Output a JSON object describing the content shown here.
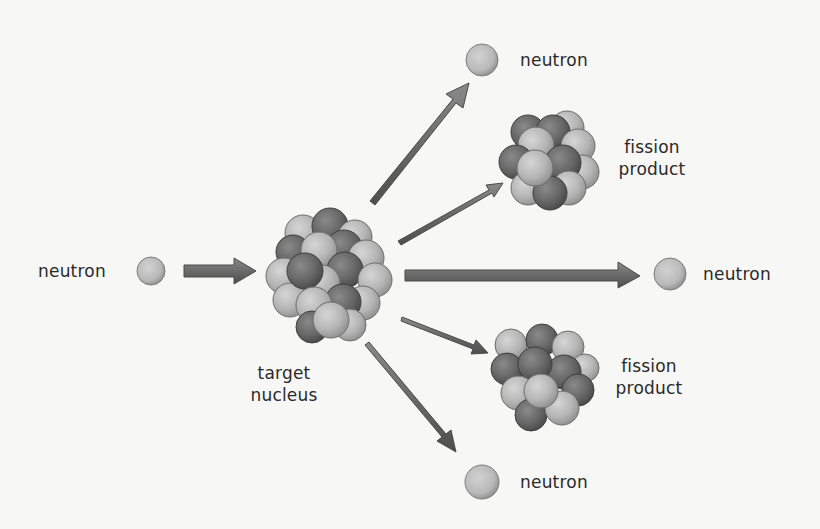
{
  "diagram": {
    "colors": {
      "background": "#f7f7f5",
      "text": "#2a2a2a",
      "arrow": "#6e6e6e",
      "arrow_dark": "#4a4a4a",
      "light_nucleon": "#b8b8b8",
      "dark_nucleon": "#6a6a6a",
      "neutron": "#bdbdbd"
    },
    "nodes": [
      {
        "id": "incoming-neutron",
        "label": "neutron"
      },
      {
        "id": "target-nucleus",
        "label_line1": "target",
        "label_line2": "nucleus"
      },
      {
        "id": "top-neutron",
        "label": "neutron"
      },
      {
        "id": "upper-fission-product",
        "label_line1": "fission",
        "label_line2": "product"
      },
      {
        "id": "right-neutron",
        "label": "neutron"
      },
      {
        "id": "lower-fission-product",
        "label_line1": "fission",
        "label_line2": "product"
      },
      {
        "id": "bottom-neutron",
        "label": "neutron"
      }
    ],
    "edges": [
      {
        "from": "incoming-neutron",
        "to": "target-nucleus"
      },
      {
        "from": "target-nucleus",
        "to": "top-neutron"
      },
      {
        "from": "target-nucleus",
        "to": "upper-fission-product"
      },
      {
        "from": "target-nucleus",
        "to": "right-neutron"
      },
      {
        "from": "target-nucleus",
        "to": "lower-fission-product"
      },
      {
        "from": "target-nucleus",
        "to": "bottom-neutron"
      }
    ]
  }
}
